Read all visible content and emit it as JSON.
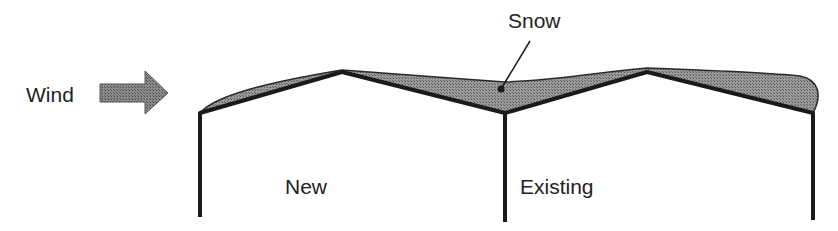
{
  "diagram": {
    "labels": {
      "wind": "Wind",
      "snow": "Snow",
      "new_building": "New",
      "existing_building": "Existing"
    },
    "colors": {
      "structure": "#1a1a1a",
      "snow_fill": "#8c8c8c",
      "arrow_fill": "#7a7a7a",
      "text": "#222222",
      "background": "#ffffff"
    },
    "elements": [
      {
        "type": "arrow",
        "label": "Wind",
        "direction": "right"
      },
      {
        "type": "building",
        "label": "New",
        "roof": "gable"
      },
      {
        "type": "building",
        "label": "Existing",
        "roof": "gable"
      },
      {
        "type": "snow-drift",
        "label": "Snow",
        "location": "roof-valley-and-slopes"
      }
    ]
  }
}
